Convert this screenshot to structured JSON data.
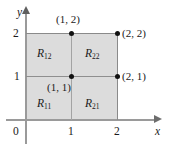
{
  "figure": {
    "background_color": "#ffffff",
    "shaded_color": "#dcdcdc",
    "axis_color": "#9a9a9a",
    "text_color": "#1a1a1a"
  },
  "axes": {
    "x_name": "x",
    "y_name": "y",
    "origin_label": "0",
    "x_ticks": [
      "1",
      "2"
    ],
    "y_ticks": [
      "1",
      "2"
    ]
  },
  "points": [
    {
      "name": "point-1-2",
      "label": "(1, 2)"
    },
    {
      "name": "point-2-2",
      "label": "(2, 2)"
    },
    {
      "name": "point-2-1",
      "label": "(2, 1)"
    },
    {
      "name": "point-1-1",
      "label": "(1, 1)"
    }
  ],
  "regions": [
    {
      "name": "region-r12",
      "base": "R",
      "sub": "12"
    },
    {
      "name": "region-r22",
      "base": "R",
      "sub": "22"
    },
    {
      "name": "region-r11",
      "base": "R",
      "sub": "11"
    },
    {
      "name": "region-r21",
      "base": "R",
      "sub": "21"
    }
  ],
  "chart_data": {
    "type": "scatter",
    "title": "",
    "xlabel": "x",
    "ylabel": "y",
    "xlim": [
      0,
      2.6
    ],
    "ylim": [
      0,
      2.4
    ],
    "xticks": [
      0,
      1,
      2
    ],
    "yticks": [
      1,
      2
    ],
    "grid": false,
    "x": [
      1,
      2,
      2,
      1
    ],
    "y": [
      2,
      2,
      1,
      1
    ],
    "point_labels": [
      "(1, 2)",
      "(2, 2)",
      "(2, 1)",
      "(1, 1)"
    ],
    "shaded_region": {
      "x_range": [
        0,
        2
      ],
      "y_range": [
        0,
        2
      ]
    },
    "subrectangles": [
      {
        "label": "R11",
        "x_range": [
          0,
          1
        ],
        "y_range": [
          0,
          1
        ]
      },
      {
        "label": "R21",
        "x_range": [
          1,
          2
        ],
        "y_range": [
          0,
          1
        ]
      },
      {
        "label": "R12",
        "x_range": [
          0,
          1
        ],
        "y_range": [
          1,
          2
        ]
      },
      {
        "label": "R22",
        "x_range": [
          1,
          2
        ],
        "y_range": [
          1,
          2
        ]
      }
    ],
    "annotations": [
      "R12",
      "R22",
      "R11",
      "R21"
    ]
  }
}
